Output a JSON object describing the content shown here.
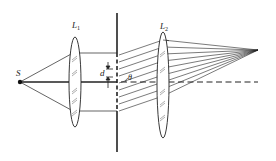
{
  "diagram": {
    "type": "optics-diffraction-grating",
    "labels": {
      "source": "S",
      "lens1": "L",
      "lens1_sub": "1",
      "lens2": "L",
      "lens2_sub": "2",
      "spacing": "d",
      "angle": "θ"
    },
    "colors": {
      "line": "#222222",
      "background": "#ffffff"
    }
  }
}
